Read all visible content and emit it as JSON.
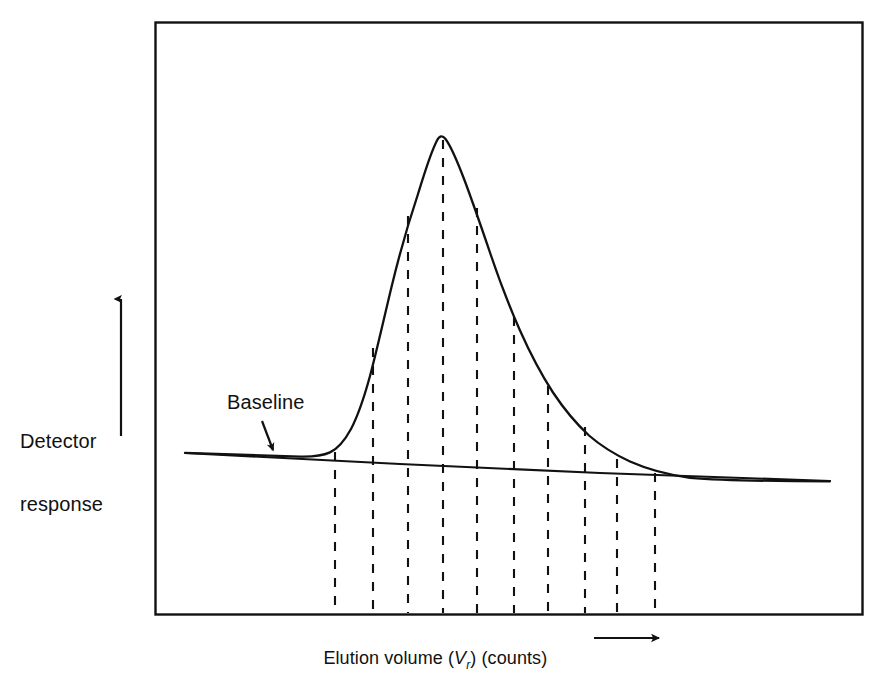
{
  "figure": {
    "kind": "chromatogram-peak-plot",
    "background_color": "#ffffff",
    "line_color": "#111111",
    "frame": {
      "x0": 155,
      "y0": 22,
      "x1": 862,
      "y1": 614
    }
  },
  "labels": {
    "y_axis_line1": "Detector",
    "y_axis_line2": "response",
    "baseline_annotation": "Baseline",
    "x_axis_prefix": "Elution volume (",
    "x_axis_symbol": "V",
    "x_axis_symbol_sub": "r",
    "x_axis_suffix": ") (counts)"
  },
  "icons": {
    "y_axis_arrow": "arrow-up-icon",
    "x_axis_arrow": "arrow-right-icon",
    "baseline_pointer": "arrow-down-right-icon"
  },
  "chart_data": {
    "type": "line",
    "title": "",
    "xlabel": "Elution volume (Vr) (counts)",
    "ylabel": "Detector response",
    "grid": false,
    "legend": null,
    "axis_ticks": {
      "x": [],
      "y": []
    },
    "axis_direction_arrows": {
      "x": "increasing-right",
      "y": "increasing-up"
    },
    "series": [
      {
        "name": "detector-response-curve",
        "style": "solid",
        "points": [
          [
            185,
            453
          ],
          [
            230,
            455
          ],
          [
            270,
            456
          ],
          [
            300,
            457
          ],
          [
            320,
            456
          ],
          [
            332,
            452
          ],
          [
            342,
            444
          ],
          [
            350,
            432
          ],
          [
            358,
            414
          ],
          [
            366,
            390
          ],
          [
            373,
            362
          ],
          [
            380,
            330
          ],
          [
            388,
            296
          ],
          [
            396,
            262
          ],
          [
            404,
            230
          ],
          [
            412,
            200
          ],
          [
            420,
            172
          ],
          [
            428,
            150
          ],
          [
            436,
            137
          ],
          [
            444,
            136
          ],
          [
            452,
            144
          ],
          [
            460,
            160
          ],
          [
            468,
            182
          ],
          [
            477,
            208
          ],
          [
            486,
            236
          ],
          [
            495,
            264
          ],
          [
            505,
            292
          ],
          [
            514,
            317
          ],
          [
            524,
            341
          ],
          [
            534,
            363
          ],
          [
            544,
            383
          ],
          [
            555,
            400
          ],
          [
            566,
            415
          ],
          [
            578,
            429
          ],
          [
            590,
            440
          ],
          [
            602,
            450
          ],
          [
            615,
            458
          ],
          [
            628,
            464
          ],
          [
            642,
            469
          ],
          [
            656,
            473
          ],
          [
            672,
            476
          ],
          [
            690,
            478
          ],
          [
            710,
            479
          ],
          [
            740,
            480
          ],
          [
            780,
            481
          ],
          [
            830,
            481
          ]
        ]
      },
      {
        "name": "baseline",
        "style": "solid",
        "points": [
          [
            185,
            453
          ],
          [
            400,
            464
          ],
          [
            600,
            473
          ],
          [
            830,
            481
          ]
        ]
      }
    ],
    "slice_lines": [
      {
        "index": 1,
        "x": 335,
        "y_curve": 452,
        "y_bottom": 613,
        "label": ""
      },
      {
        "index": 2,
        "x": 373,
        "y_curve": 348,
        "y_bottom": 613,
        "label": ""
      },
      {
        "index": 3,
        "x": 408,
        "y_curve": 216,
        "y_bottom": 613,
        "label": ""
      },
      {
        "index": 4,
        "x": 443,
        "y_curve": 140,
        "y_bottom": 613,
        "label": ""
      },
      {
        "index": 5,
        "x": 477,
        "y_curve": 208,
        "y_bottom": 613,
        "label": ""
      },
      {
        "index": 6,
        "x": 514,
        "y_curve": 317,
        "y_bottom": 613,
        "label": ""
      },
      {
        "index": 7,
        "x": 548,
        "y_curve": 386,
        "y_bottom": 613,
        "label": ""
      },
      {
        "index": 8,
        "x": 585,
        "y_curve": 427,
        "y_bottom": 613,
        "label": ""
      },
      {
        "index": 9,
        "x": 617,
        "y_curve": 459,
        "y_bottom": 613,
        "label": ""
      },
      {
        "index": 10,
        "x": 655,
        "y_curve": 473,
        "y_bottom": 613,
        "label": ""
      }
    ],
    "annotations": [
      {
        "name": "baseline-callout",
        "text": "Baseline",
        "text_x": 227,
        "text_y": 392,
        "arrow_from": [
          262,
          421
        ],
        "arrow_to": [
          273,
          450
        ]
      }
    ]
  }
}
